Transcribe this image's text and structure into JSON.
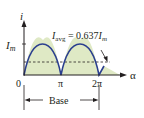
{
  "diagram": {
    "y_axis_label": "i",
    "x_axis_label": "α",
    "peak_label": "I",
    "peak_sub": "m",
    "avg_label_main": "I",
    "avg_label_sub": "avg",
    "avg_label_eq": " = 0.637",
    "avg_label_I": "I",
    "avg_label_m": "m",
    "x_ticks": [
      "0",
      "π",
      "2π"
    ],
    "base_label": "Base",
    "colors": {
      "curve": "#2b3f8f",
      "fill": "#dfe9c5",
      "axis": "#231f20"
    }
  }
}
